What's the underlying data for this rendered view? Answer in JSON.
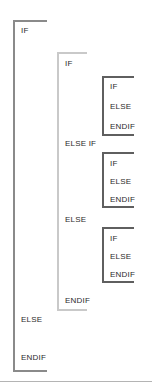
{
  "diagram": {
    "colors": {
      "outer_bracket": "#8a8a8a",
      "middle_bracket": "#c9c9c9",
      "inner_bracket": "#5f5f5f",
      "text": "#2b2b2b",
      "footer_rule": "#b4b4b4",
      "background": "#ffffff"
    },
    "brackets": [
      {
        "id": "outer",
        "level": 0,
        "x": 13,
        "y": 20,
        "width": 34,
        "height": 352
      },
      {
        "id": "middle",
        "level": 1,
        "x": 57,
        "y": 52,
        "width": 30,
        "height": 259
      },
      {
        "id": "inner1",
        "level": 2,
        "x": 102,
        "y": 76,
        "width": 32,
        "height": 60
      },
      {
        "id": "inner2",
        "level": 2,
        "x": 102,
        "y": 152,
        "width": 32,
        "height": 56
      },
      {
        "id": "inner3",
        "level": 2,
        "x": 102,
        "y": 227,
        "width": 32,
        "height": 56
      }
    ],
    "labels": [
      {
        "id": "outer-if",
        "text": "IF",
        "x": 21,
        "y": 26,
        "owner": "outer"
      },
      {
        "id": "outer-else",
        "text": "ELSE",
        "x": 21,
        "y": 315,
        "owner": "outer"
      },
      {
        "id": "outer-endif",
        "text": "ENDIF",
        "x": 21,
        "y": 353,
        "owner": "outer"
      },
      {
        "id": "mid-if",
        "text": "IF",
        "x": 65,
        "y": 59,
        "owner": "middle"
      },
      {
        "id": "mid-elseif",
        "text": "ELSE IF",
        "x": 65,
        "y": 139,
        "owner": "middle"
      },
      {
        "id": "mid-else",
        "text": "ELSE",
        "x": 65,
        "y": 215,
        "owner": "middle"
      },
      {
        "id": "mid-endif",
        "text": "ENDIF",
        "x": 65,
        "y": 296,
        "owner": "middle"
      },
      {
        "id": "in1-if",
        "text": "IF",
        "x": 110,
        "y": 82,
        "owner": "inner1"
      },
      {
        "id": "in1-else",
        "text": "ELSE",
        "x": 110,
        "y": 100,
        "owner": "inner1"
      },
      {
        "id": "in1-endif",
        "text": "ENDIF",
        "x": 110,
        "y": 124,
        "owner": "inner1"
      },
      {
        "id": "in2-if",
        "text": "IF",
        "x": 110,
        "y": 159,
        "owner": "inner2"
      },
      {
        "id": "in2-else",
        "text": "ELSE",
        "x": 110,
        "y": 177,
        "owner": "inner2"
      },
      {
        "id": "in2-endif",
        "text": "ENDIF",
        "x": 110,
        "y": 195,
        "owner": "inner2"
      },
      {
        "id": "in3-if",
        "text": "IF",
        "x": 110,
        "y": 234,
        "owner": "inner3"
      },
      {
        "id": "in3-else",
        "text": "ELSE",
        "x": 110,
        "y": 252,
        "owner": "inner3"
      },
      {
        "id": "in3-endif",
        "text": "ENDIF",
        "x": 110,
        "y": 270,
        "owner": "inner3"
      }
    ],
    "footer_rule": {
      "y": 381
    }
  }
}
